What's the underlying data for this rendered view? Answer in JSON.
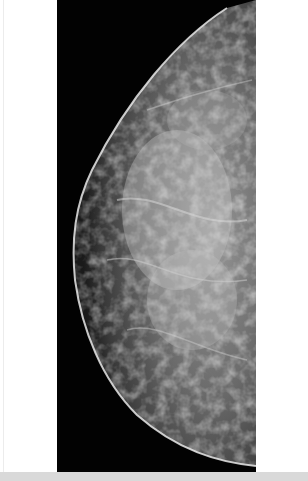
{
  "image": {
    "kind": "mammogram",
    "view": "craniocaudal-like, breast facing left",
    "background_color": "#020202",
    "tissue_color": "#b8b8b8",
    "skin_line_color": "#e8e8e8",
    "page_background": "#ffffff",
    "bottom_band_color": "#d9d9d9"
  },
  "caption": ""
}
